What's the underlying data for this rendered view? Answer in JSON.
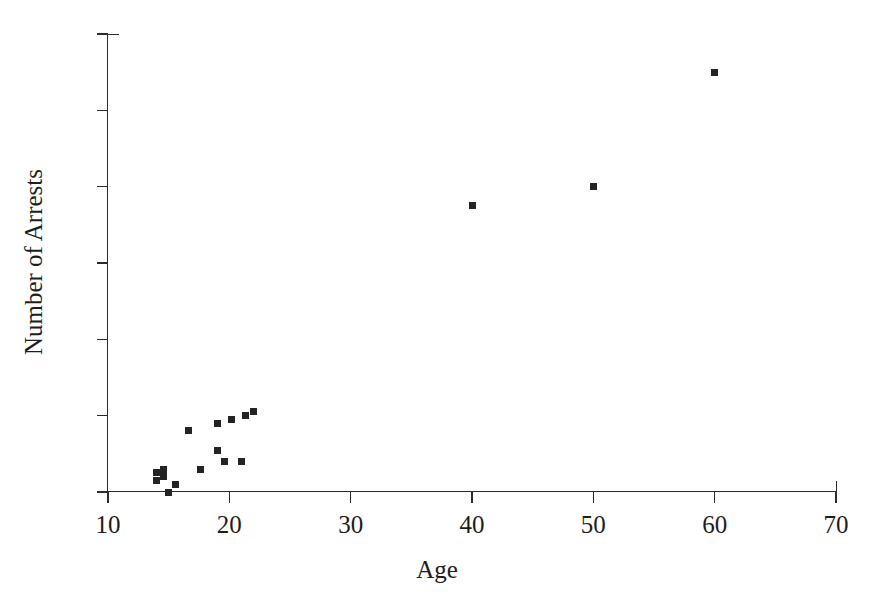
{
  "chart_data": {
    "type": "scatter",
    "title": "",
    "xlabel": "Age",
    "ylabel": "Number of Arrests",
    "xlim": [
      10,
      70
    ],
    "ylim": [
      0,
      60
    ],
    "xticks": [
      10,
      20,
      30,
      40,
      50,
      60,
      70
    ],
    "yticks": [
      0,
      10,
      20,
      30,
      40,
      50,
      60
    ],
    "xtick_labels": [
      "10",
      "20",
      "30",
      "40",
      "50",
      "60",
      "70"
    ],
    "ytick_labels": [
      "0",
      "10",
      "20",
      "30",
      "40",
      "50",
      "60"
    ],
    "grid": false,
    "legend": null,
    "marker": "square",
    "marker_color": "#232323",
    "series": [
      {
        "name": "Arrests by age",
        "points": [
          {
            "x": 14.0,
            "y": 2.5
          },
          {
            "x": 14.0,
            "y": 1.5
          },
          {
            "x": 14.6,
            "y": 3.0
          },
          {
            "x": 14.6,
            "y": 2.0
          },
          {
            "x": 15.0,
            "y": 0.0
          },
          {
            "x": 15.6,
            "y": 1.0
          },
          {
            "x": 16.6,
            "y": 8.0
          },
          {
            "x": 17.6,
            "y": 3.0
          },
          {
            "x": 19.0,
            "y": 9.0
          },
          {
            "x": 19.0,
            "y": 5.5
          },
          {
            "x": 19.6,
            "y": 4.0
          },
          {
            "x": 20.2,
            "y": 9.5
          },
          {
            "x": 21.0,
            "y": 4.0
          },
          {
            "x": 21.3,
            "y": 10.0
          },
          {
            "x": 22.0,
            "y": 10.5
          },
          {
            "x": 40.0,
            "y": 37.5
          },
          {
            "x": 50.0,
            "y": 40.0
          },
          {
            "x": 60.0,
            "y": 55.0
          }
        ]
      }
    ]
  },
  "axes": {
    "x_title": "Age",
    "y_title": "Number of Arrests"
  }
}
